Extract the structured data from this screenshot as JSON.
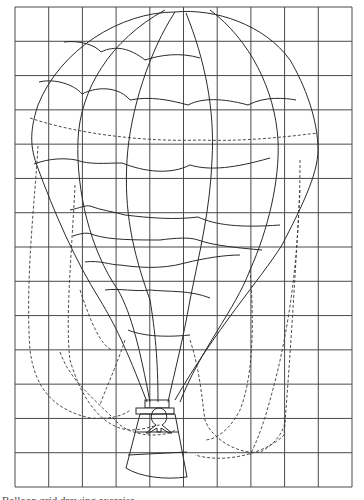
{
  "grid": {
    "left": 15,
    "top": 7,
    "right": 352,
    "bottom": 487,
    "columns": 10,
    "rows": 14,
    "line_color": "#4a4a4a"
  },
  "colors": {
    "background": "#ffffff",
    "outline": "#2a2a2a",
    "guide_dashes": "#3a3a3a"
  },
  "subject": {
    "name": "hot-air-balloon",
    "parts": [
      "envelope",
      "gores",
      "horizontal-seams",
      "load-lines",
      "basket",
      "passenger-silhouette",
      "dashed-guide-curves"
    ]
  },
  "caption": {
    "text": "Balloon grid drawing exercise"
  }
}
